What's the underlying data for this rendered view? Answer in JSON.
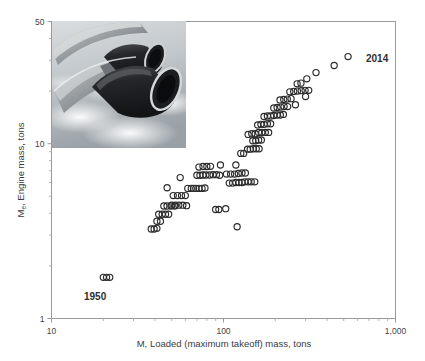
{
  "chart_data": {
    "type": "scatter",
    "title": "",
    "xlabel": "M, Loaded (maximum takeoff) mass, tons",
    "ylabel": "M e, Engine mass, tons",
    "ylabel_main": "M",
    "ylabel_sub": "e",
    "ylabel_rest": ", Engine mass, tons",
    "xscale": "log",
    "yscale": "log",
    "xlim": [
      10,
      1000
    ],
    "ylim": [
      1,
      50
    ],
    "xticks": [
      10,
      100,
      1000
    ],
    "xtick_labels": [
      "10",
      "100",
      "1,000"
    ],
    "yticks": [
      1,
      10,
      50
    ],
    "ytick_labels": [
      "1",
      "10",
      "50"
    ],
    "grid": false,
    "legend": null,
    "marker": "open-circle",
    "marker_color": "#2b2b2b",
    "annotations": [
      {
        "text": "1950",
        "x": 21,
        "y": 1.45,
        "name": "annotation-1950"
      },
      {
        "text": "2014",
        "x": 620,
        "y": 27.5,
        "name": "annotation-2014"
      }
    ],
    "inset_image": {
      "name": "aircraft-engines-photo",
      "description": "Photograph of two jet engines mounted under an airliner wing above clouds",
      "x_range": [
        10,
        100
      ],
      "y_range": [
        10,
        50
      ]
    },
    "points": [
      {
        "x": 20.0,
        "y": 1.72
      },
      {
        "x": 20.9,
        "y": 1.72
      },
      {
        "x": 21.8,
        "y": 1.72
      },
      {
        "x": 38.0,
        "y": 3.25
      },
      {
        "x": 39.5,
        "y": 3.25
      },
      {
        "x": 41.0,
        "y": 3.28
      },
      {
        "x": 41.0,
        "y": 3.6
      },
      {
        "x": 43.0,
        "y": 3.6
      },
      {
        "x": 42.0,
        "y": 3.95
      },
      {
        "x": 44.0,
        "y": 3.95
      },
      {
        "x": 46.0,
        "y": 3.95
      },
      {
        "x": 48.0,
        "y": 3.95
      },
      {
        "x": 45.0,
        "y": 4.4
      },
      {
        "x": 47.0,
        "y": 4.4
      },
      {
        "x": 49.5,
        "y": 4.4
      },
      {
        "x": 52.0,
        "y": 4.4
      },
      {
        "x": 50.0,
        "y": 4.45
      },
      {
        "x": 52.5,
        "y": 4.45
      },
      {
        "x": 55.0,
        "y": 4.45
      },
      {
        "x": 58.0,
        "y": 4.45
      },
      {
        "x": 61.0,
        "y": 4.42
      },
      {
        "x": 51.0,
        "y": 5.05
      },
      {
        "x": 54.0,
        "y": 5.05
      },
      {
        "x": 57.0,
        "y": 5.05
      },
      {
        "x": 60.0,
        "y": 5.05
      },
      {
        "x": 47.0,
        "y": 5.6
      },
      {
        "x": 62.0,
        "y": 5.55
      },
      {
        "x": 65.0,
        "y": 5.55
      },
      {
        "x": 67.0,
        "y": 5.55
      },
      {
        "x": 69.0,
        "y": 5.55
      },
      {
        "x": 72.0,
        "y": 5.55
      },
      {
        "x": 75.0,
        "y": 5.55
      },
      {
        "x": 78.0,
        "y": 5.58
      },
      {
        "x": 56.0,
        "y": 6.4
      },
      {
        "x": 70.0,
        "y": 6.6
      },
      {
        "x": 73.0,
        "y": 6.6
      },
      {
        "x": 76.0,
        "y": 6.62
      },
      {
        "x": 79.0,
        "y": 6.62
      },
      {
        "x": 83.0,
        "y": 6.62
      },
      {
        "x": 87.0,
        "y": 6.65
      },
      {
        "x": 91.0,
        "y": 6.65
      },
      {
        "x": 95.0,
        "y": 6.6
      },
      {
        "x": 72.0,
        "y": 7.35
      },
      {
        "x": 76.0,
        "y": 7.4
      },
      {
        "x": 80.0,
        "y": 7.4
      },
      {
        "x": 84.0,
        "y": 7.42
      },
      {
        "x": 90.0,
        "y": 4.2
      },
      {
        "x": 94.0,
        "y": 4.2
      },
      {
        "x": 103.0,
        "y": 4.25
      },
      {
        "x": 120.0,
        "y": 3.35
      },
      {
        "x": 108.0,
        "y": 5.95
      },
      {
        "x": 113.0,
        "y": 5.95
      },
      {
        "x": 118.0,
        "y": 6.0
      },
      {
        "x": 123.0,
        "y": 6.0
      },
      {
        "x": 128.0,
        "y": 6.0
      },
      {
        "x": 133.0,
        "y": 6.05
      },
      {
        "x": 139.0,
        "y": 6.05
      },
      {
        "x": 145.0,
        "y": 6.05
      },
      {
        "x": 152.0,
        "y": 6.05
      },
      {
        "x": 104.0,
        "y": 6.7
      },
      {
        "x": 110.0,
        "y": 6.7
      },
      {
        "x": 116.0,
        "y": 6.7
      },
      {
        "x": 122.0,
        "y": 6.75
      },
      {
        "x": 128.0,
        "y": 6.8
      },
      {
        "x": 134.0,
        "y": 6.8
      },
      {
        "x": 96.0,
        "y": 7.55
      },
      {
        "x": 118.0,
        "y": 7.55
      },
      {
        "x": 126.0,
        "y": 8.8
      },
      {
        "x": 131.0,
        "y": 8.8
      },
      {
        "x": 138.0,
        "y": 9.3
      },
      {
        "x": 143.0,
        "y": 9.3
      },
      {
        "x": 149.0,
        "y": 9.35
      },
      {
        "x": 155.0,
        "y": 9.35
      },
      {
        "x": 161.0,
        "y": 9.35
      },
      {
        "x": 148.0,
        "y": 10.4
      },
      {
        "x": 154.0,
        "y": 10.4
      },
      {
        "x": 160.0,
        "y": 10.5
      },
      {
        "x": 166.0,
        "y": 10.5
      },
      {
        "x": 139.0,
        "y": 11.3
      },
      {
        "x": 146.0,
        "y": 11.4
      },
      {
        "x": 153.0,
        "y": 11.4
      },
      {
        "x": 160.0,
        "y": 11.6
      },
      {
        "x": 167.0,
        "y": 11.6
      },
      {
        "x": 175.0,
        "y": 11.6
      },
      {
        "x": 183.0,
        "y": 11.6
      },
      {
        "x": 158.0,
        "y": 12.8
      },
      {
        "x": 165.0,
        "y": 12.9
      },
      {
        "x": 172.0,
        "y": 12.9
      },
      {
        "x": 180.0,
        "y": 13.0
      },
      {
        "x": 188.0,
        "y": 13.0
      },
      {
        "x": 172.0,
        "y": 14.3
      },
      {
        "x": 180.0,
        "y": 14.4
      },
      {
        "x": 188.0,
        "y": 14.4
      },
      {
        "x": 196.0,
        "y": 14.5
      },
      {
        "x": 205.0,
        "y": 14.6
      },
      {
        "x": 214.0,
        "y": 14.6
      },
      {
        "x": 223.0,
        "y": 14.7
      },
      {
        "x": 196.0,
        "y": 16.0
      },
      {
        "x": 205.0,
        "y": 16.1
      },
      {
        "x": 215.0,
        "y": 16.2
      },
      {
        "x": 225.0,
        "y": 16.3
      },
      {
        "x": 236.0,
        "y": 16.3
      },
      {
        "x": 213.0,
        "y": 17.8
      },
      {
        "x": 224.0,
        "y": 17.9
      },
      {
        "x": 235.0,
        "y": 18.0
      },
      {
        "x": 247.0,
        "y": 18.1
      },
      {
        "x": 243.0,
        "y": 19.8
      },
      {
        "x": 256.0,
        "y": 19.9
      },
      {
        "x": 269.0,
        "y": 20.0
      },
      {
        "x": 283.0,
        "y": 20.1
      },
      {
        "x": 298.0,
        "y": 20.2
      },
      {
        "x": 313.0,
        "y": 20.2
      },
      {
        "x": 268.0,
        "y": 22.0
      },
      {
        "x": 282.0,
        "y": 22.2
      },
      {
        "x": 305.0,
        "y": 23.5
      },
      {
        "x": 345.0,
        "y": 25.5
      },
      {
        "x": 300.0,
        "y": 18.6
      },
      {
        "x": 262.0,
        "y": 16.7
      },
      {
        "x": 440.0,
        "y": 28.0
      },
      {
        "x": 530.0,
        "y": 31.5
      }
    ]
  },
  "axis": {
    "x_title": "M, Loaded (maximum takeoff) mass, tons",
    "y_title_main": "M",
    "y_title_sub": "e",
    "y_title_rest": ", Engine mass, tons"
  }
}
